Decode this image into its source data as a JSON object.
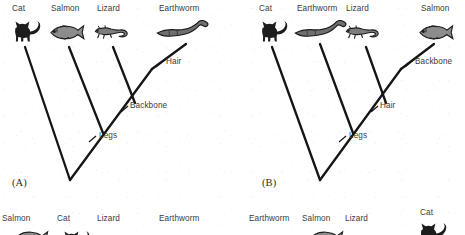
{
  "figure": {
    "type": "cladogram-pair",
    "background_color": "#ffffff",
    "line_color": "#1a1a1a",
    "text_color": "#3a3a3a"
  },
  "panelA": {
    "caption": "(A)",
    "taxa": [
      {
        "name": "Cat",
        "icon": "cat-icon"
      },
      {
        "name": "Salmon",
        "icon": "fish-icon"
      },
      {
        "name": "Lizard",
        "icon": "lizard-icon"
      },
      {
        "name": "Earthworm",
        "icon": "worm-icon"
      }
    ],
    "traits": [
      {
        "name": "Hair"
      },
      {
        "name": "Backbone"
      },
      {
        "name": "Legs"
      }
    ]
  },
  "panelB": {
    "caption": "(B)",
    "taxa": [
      {
        "name": "Cat",
        "icon": "cat-icon"
      },
      {
        "name": "Earthworm",
        "icon": "worm-icon"
      },
      {
        "name": "Lizard",
        "icon": "lizard-icon"
      },
      {
        "name": "Salmon",
        "icon": "fish-icon"
      }
    ],
    "traits": [
      {
        "name": "Backbone"
      },
      {
        "name": "Hair"
      },
      {
        "name": "Legs"
      }
    ]
  },
  "panelC": {
    "taxa": [
      {
        "name": "Salmon",
        "icon": "fish-icon"
      },
      {
        "name": "Cat",
        "icon": "cat-icon"
      },
      {
        "name": "Lizard",
        "icon": "lizard-icon"
      },
      {
        "name": "Earthworm",
        "icon": "worm-icon"
      }
    ]
  },
  "panelD": {
    "taxa": [
      {
        "name": "Earthworm",
        "icon": "worm-icon"
      },
      {
        "name": "Salmon",
        "icon": "fish-icon"
      },
      {
        "name": "Lizard",
        "icon": "lizard-icon"
      },
      {
        "name": "Cat",
        "icon": "cat-icon"
      }
    ]
  }
}
